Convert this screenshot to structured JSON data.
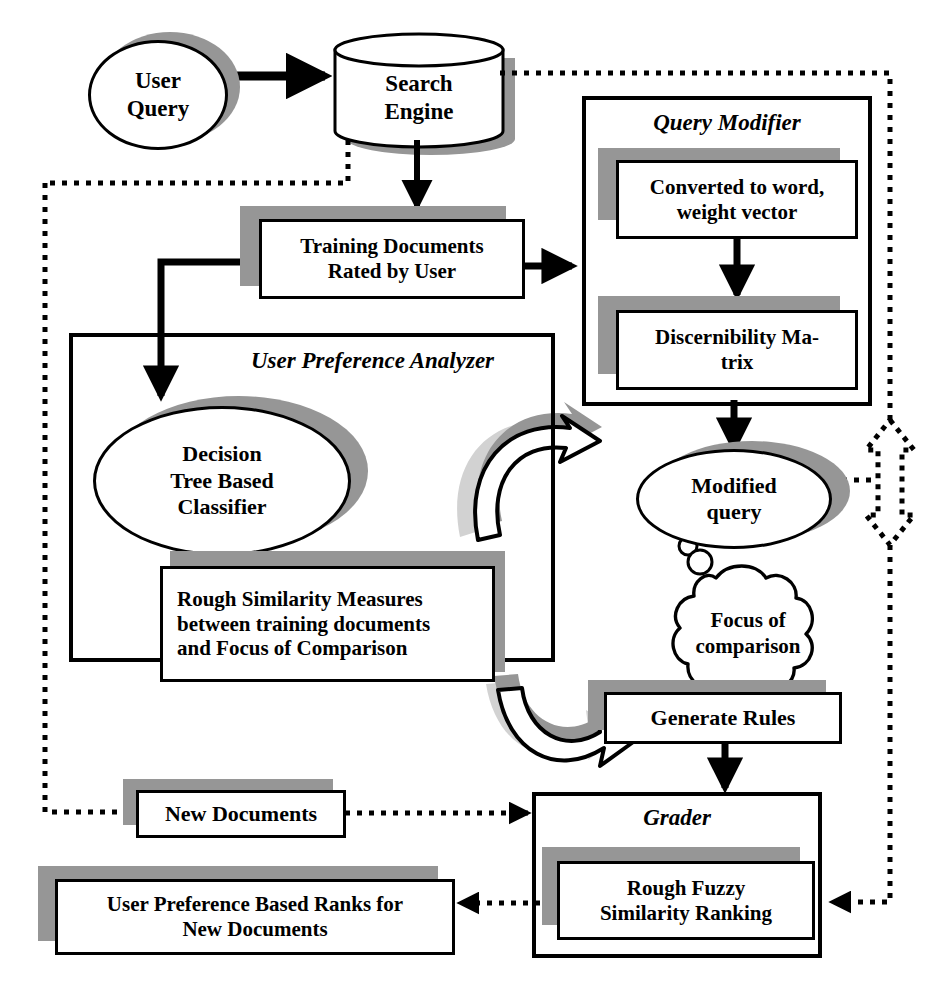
{
  "diagram": {
    "type": "flowchart",
    "palette": {
      "line": "#000000",
      "shadow": "#969696",
      "fill": "#ffffff"
    },
    "nodes": {
      "user_query": {
        "label": "User\nQuery",
        "shape": "ellipse"
      },
      "search_engine": {
        "label": "Search\nEngine",
        "shape": "cylinder"
      },
      "training_documents": {
        "label": "Training Documents\nRated by User",
        "shape": "box-shadow"
      },
      "query_modifier": {
        "label": "Query Modifier",
        "shape": "group"
      },
      "converted_to_word": {
        "label": "Converted to word,\nweight vector",
        "shape": "box-shadow"
      },
      "discernibility_matrix": {
        "label": "Discernibility  Ma-\ntrix",
        "shape": "box-shadow"
      },
      "user_preference_analyzer": {
        "label": "User Preference Analyzer",
        "shape": "group"
      },
      "decision_tree": {
        "label": "Decision\nTree Based\nClassifier",
        "shape": "ellipse"
      },
      "rough_similarity": {
        "label": "Rough  Similarity  Measures\nbetween training documents\nand Focus of Comparison",
        "shape": "box-shadow"
      },
      "modified_query": {
        "label": "Modified\nquery",
        "shape": "ellipse"
      },
      "focus_of_comparison": {
        "label": "Focus of\ncomparison",
        "shape": "cloud"
      },
      "generate_rules": {
        "label": "Generate Rules",
        "shape": "box-shadow"
      },
      "grader": {
        "label": "Grader",
        "shape": "group"
      },
      "rough_fuzzy": {
        "label": "Rough Fuzzy\nSimilarity Ranking",
        "shape": "box-shadow"
      },
      "new_documents": {
        "label": "New Documents",
        "shape": "box-shadow"
      },
      "output_ranks": {
        "label": "User Preference Based Ranks for\nNew Documents",
        "shape": "box-shadow"
      }
    },
    "edges": [
      {
        "from": "user_query",
        "to": "search_engine",
        "style": "solid-arrow"
      },
      {
        "from": "search_engine",
        "to": "training_documents",
        "style": "solid-arrow"
      },
      {
        "from": "search_engine",
        "to": "left-feedback-bus",
        "style": "dotted"
      },
      {
        "from": "search_engine",
        "to": "right-feedback-bus",
        "style": "dotted"
      },
      {
        "from": "training_documents",
        "to": "query_modifier",
        "style": "solid-arrow"
      },
      {
        "from": "training_documents",
        "to": "decision_tree",
        "style": "solid-arrow"
      },
      {
        "from": "converted_to_word",
        "to": "discernibility_matrix",
        "style": "solid-arrow"
      },
      {
        "from": "discernibility_matrix",
        "to": "modified_query",
        "style": "solid-arrow"
      },
      {
        "from": "modified_query",
        "to": "right-feedback-bus",
        "style": "dotted"
      },
      {
        "from": "rough_similarity",
        "to": "generate_rules",
        "style": "curved-3d-arrow"
      },
      {
        "from": "modified_query",
        "to": "rough_similarity",
        "style": "curved-3d-arrow"
      },
      {
        "from": "generate_rules",
        "to": "grader",
        "style": "solid-arrow"
      },
      {
        "from": "left-feedback-bus",
        "to": "new_documents",
        "style": "dotted"
      },
      {
        "from": "new_documents",
        "to": "grader",
        "style": "dotted-arrow"
      },
      {
        "from": "right-feedback-bus",
        "to": "grader",
        "style": "dotted-arrow"
      },
      {
        "from": "grader",
        "to": "output_ranks",
        "style": "dotted-arrow"
      }
    ],
    "annotations": {
      "double_arrow": "dotted-double-headed-vertical-arrow"
    }
  }
}
